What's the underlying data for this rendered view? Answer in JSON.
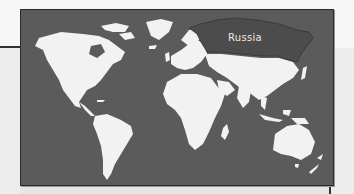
{
  "map": {
    "type": "world-map",
    "highlighted_country": "Russia",
    "labels": [
      {
        "text": "Russia",
        "x": 227,
        "y": 40
      }
    ],
    "colors": {
      "ocean": "#5b5b5b",
      "land": "#f2f2f2",
      "highlight": "#4a4a4a",
      "frame_border": "#2a2a2a",
      "background": "#f4f4f4"
    }
  }
}
